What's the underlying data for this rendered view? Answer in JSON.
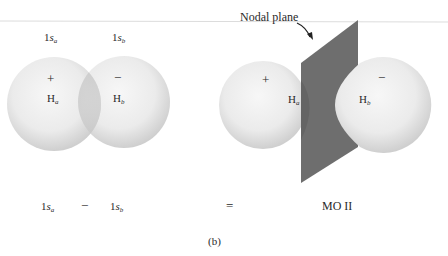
{
  "figure": {
    "caption": "(b)",
    "left_diagram": {
      "top_label_a": {
        "main": "1",
        "var": "s",
        "sub": "a"
      },
      "top_label_b": {
        "main": "1",
        "var": "s",
        "sub": "b"
      },
      "lobe_a": {
        "sign": "+",
        "atom": "H",
        "atom_sub": "a"
      },
      "lobe_b": {
        "sign": "−",
        "atom": "H",
        "atom_sub": "b"
      }
    },
    "right_diagram": {
      "annotation": "Nodal plane",
      "lobe_a": {
        "sign": "+",
        "atom": "H",
        "atom_sub": "a"
      },
      "lobe_b": {
        "sign": "−",
        "atom": "H",
        "atom_sub": "b"
      }
    },
    "equation": {
      "term_a": {
        "main": "1",
        "var": "s",
        "sub": "a"
      },
      "operator": "−",
      "term_b": {
        "main": "1",
        "var": "s",
        "sub": "b"
      },
      "equals": "=",
      "result": "MO II"
    },
    "colors": {
      "sphere_light": "#f4f4f4",
      "sphere_dark": "#c9c9c9",
      "plane": "#6e6e6e",
      "plane_dark": "#5a5a5a",
      "text": "#2a2a2a",
      "rule": "#d8d8d8"
    }
  }
}
